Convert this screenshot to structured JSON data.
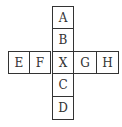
{
  "diagram": {
    "type": "cube-net",
    "cells": [
      {
        "label": "A",
        "col": 2,
        "row": 0
      },
      {
        "label": "B",
        "col": 2,
        "row": 1
      },
      {
        "label": "E",
        "col": 0,
        "row": 2
      },
      {
        "label": "F",
        "col": 1,
        "row": 2
      },
      {
        "label": "X",
        "col": 2,
        "row": 2
      },
      {
        "label": "G",
        "col": 3,
        "row": 2
      },
      {
        "label": "H",
        "col": 4,
        "row": 2
      },
      {
        "label": "C",
        "col": 2,
        "row": 3
      },
      {
        "label": "D",
        "col": 2,
        "row": 4
      }
    ]
  }
}
